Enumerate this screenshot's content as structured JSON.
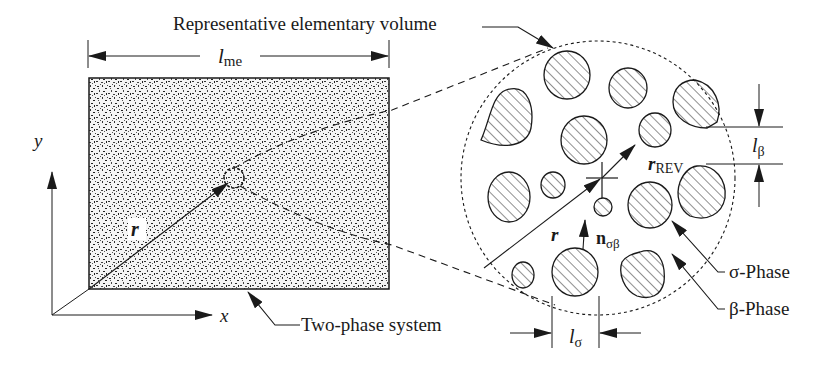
{
  "figure": {
    "title_label": "Representative elementary volume",
    "left_panel": {
      "name": "Two-phase system",
      "length_label": {
        "base": "l",
        "sub": "me"
      },
      "axis_x_label": "x",
      "axis_y_label": "y",
      "position_vector_label": "r"
    },
    "right_panel": {
      "name": "Representative elementary volume (magnified)",
      "position_vector_label": "r",
      "radius_label": {
        "base": "r",
        "sub": "REV"
      },
      "normal_label": {
        "base": "n",
        "sub": "σβ"
      },
      "beta_length_label": {
        "base": "l",
        "sub": "β"
      },
      "sigma_length_label": {
        "base": "l",
        "sub": "σ"
      },
      "sigma_phase_label": "σ-Phase",
      "beta_phase_label": "β-Phase"
    },
    "colors": {
      "ink": "#1a1a1a",
      "background": "#ffffff"
    }
  }
}
